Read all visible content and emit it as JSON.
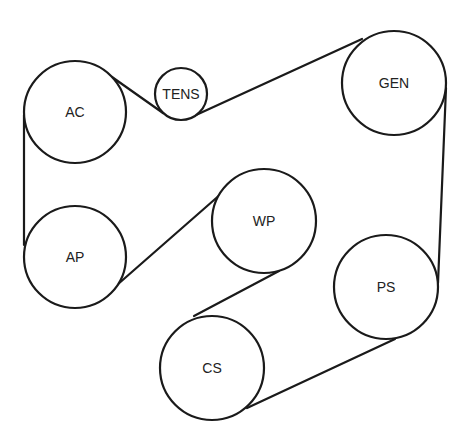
{
  "diagram": {
    "title": "",
    "type": "serpentine-belt-routing",
    "colors": {
      "line": "#1a1a1a",
      "background": "#ffffff",
      "text": "#222222"
    },
    "pulleys": [
      {
        "id": "ac",
        "label": "AC",
        "cx": 75,
        "cy": 112,
        "r": 51
      },
      {
        "id": "tens",
        "label": "TENS",
        "cx": 181,
        "cy": 94,
        "r": 26
      },
      {
        "id": "gen",
        "label": "GEN",
        "cx": 394,
        "cy": 83,
        "r": 52
      },
      {
        "id": "ap",
        "label": "AP",
        "cx": 75,
        "cy": 257,
        "r": 51
      },
      {
        "id": "wp",
        "label": "WP",
        "cx": 264,
        "cy": 221,
        "r": 52
      },
      {
        "id": "ps",
        "label": "PS",
        "cx": 386,
        "cy": 287,
        "r": 52
      },
      {
        "id": "cs",
        "label": "CS",
        "cx": 212,
        "cy": 368,
        "r": 52
      }
    ],
    "belt_segments": [
      {
        "from": "ac",
        "to": "tens",
        "x1": 112,
        "y1": 77,
        "x2": 163,
        "y2": 113
      },
      {
        "from": "tens",
        "to": "gen",
        "x1": 196,
        "y1": 115,
        "x2": 362,
        "y2": 39
      },
      {
        "from": "gen",
        "to": "ps",
        "x1": 446,
        "y1": 88,
        "x2": 438,
        "y2": 283
      },
      {
        "from": "ps",
        "to": "cs",
        "x1": 395,
        "y1": 339,
        "x2": 247,
        "y2": 408
      },
      {
        "from": "cs",
        "to": "wp",
        "x1": 194,
        "y1": 316,
        "x2": 279,
        "y2": 271
      },
      {
        "from": "wp",
        "to": "ap",
        "x1": 222,
        "y1": 193,
        "x2": 117,
        "y2": 285
      },
      {
        "from": "ap",
        "to": "ac",
        "x1": 24,
        "y1": 245,
        "x2": 24,
        "y2": 115
      }
    ]
  }
}
